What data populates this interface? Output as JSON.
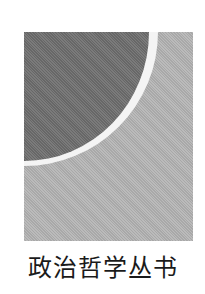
{
  "emblem": {
    "colors": {
      "dark": "#707070",
      "light": "#b3b3b3",
      "ring": "#f4f4f4"
    }
  },
  "title": "政治哲学丛书"
}
